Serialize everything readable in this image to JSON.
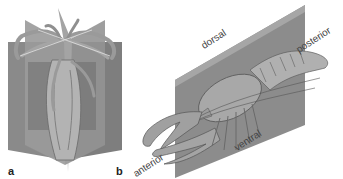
{
  "figure": {
    "panels": [
      {
        "id": "a",
        "label": "a",
        "subject": "radially symmetric animal (sea anemone / hydra-like) with three intersecting planes"
      },
      {
        "id": "b",
        "label": "b",
        "subject": "bilaterally symmetric animal (crayfish) with single sagittal plane"
      }
    ],
    "directions": {
      "dorsal": "dorsal",
      "posterior": "posterior",
      "anterior": "anterior",
      "ventral": "ventral"
    },
    "colors": {
      "plane": "#8a8a8a",
      "plane_dark": "#6e6e6e",
      "plane_light": "#a9a9a9",
      "animal": "#b8b8b8",
      "animal_shade": "#7d7d7d",
      "text": "#444444",
      "background": "#ffffff"
    }
  }
}
